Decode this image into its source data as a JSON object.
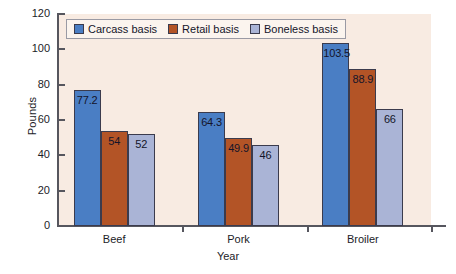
{
  "chart_data": {
    "type": "bar",
    "title": "",
    "xlabel": "Year",
    "ylabel": "Pounds",
    "ylim": [
      0,
      120
    ],
    "yticks": [
      0,
      20,
      40,
      60,
      80,
      100,
      120
    ],
    "grid": false,
    "legend_position": "top-left",
    "categories": [
      "Beef",
      "Pork",
      "Broiler"
    ],
    "series": [
      {
        "name": "Carcass basis",
        "color": "#4a7ec4",
        "values": [
          77.2,
          64.3,
          103.5
        ],
        "labels": [
          "77.2",
          "64.3",
          "103.5"
        ]
      },
      {
        "name": "Retail basis",
        "color": "#b35426",
        "values": [
          54,
          49.9,
          88.9
        ],
        "labels": [
          "54",
          "49.9",
          "88.9"
        ]
      },
      {
        "name": "Boneless basis",
        "color": "#aab4d6",
        "values": [
          52,
          46,
          66
        ],
        "labels": [
          "52",
          "46",
          "66"
        ]
      }
    ]
  },
  "axes": {
    "y_title": "Pounds",
    "x_title": "Year",
    "y_tick_labels": [
      "0",
      "20",
      "40",
      "60",
      "80",
      "100",
      "120"
    ],
    "x_tick_labels": [
      "Beef",
      "Pork",
      "Broiler"
    ]
  },
  "legend": {
    "items": [
      {
        "label": "Carcass basis"
      },
      {
        "label": "Retail basis"
      },
      {
        "label": "Boneless basis"
      }
    ]
  },
  "colors": {
    "plot_background": "#f8ebe2",
    "page_background": "#ffffff",
    "axis": "#56565e",
    "bar_outline": "#3b3b4d",
    "text": "#14142a",
    "series_1": "#4a7ec4",
    "series_2": "#b35426",
    "series_3": "#aab4d6"
  }
}
